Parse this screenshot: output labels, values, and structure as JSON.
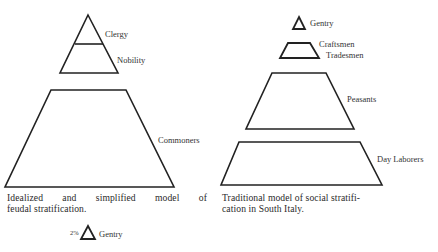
{
  "left_figure": {
    "labels": {
      "clergy": "Clergy",
      "nobility": "Nobility",
      "commoners": "Commoners"
    },
    "caption_line1": "Idealized and simplified model of",
    "caption_line2": "feudal stratification."
  },
  "right_figure": {
    "labels": {
      "gentry": "Gentry",
      "craftsmen": "Craftsmen",
      "tradesmen": "Tradesmen",
      "peasants": "Peasants",
      "day_laborers": "Day Laborers"
    },
    "caption_line1": "Traditional model of social stratifi-",
    "caption_line2": "cation in South Italy."
  },
  "bottom_figure": {
    "percent": "2%",
    "label": "Gentry"
  },
  "colors": {
    "stroke": "#222222",
    "background": "#ffffff"
  }
}
